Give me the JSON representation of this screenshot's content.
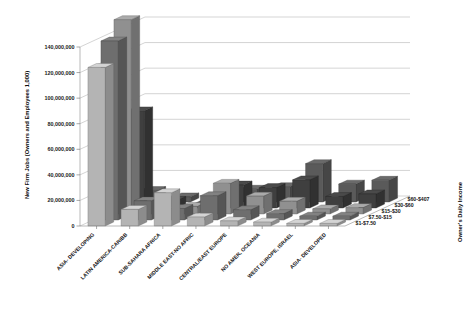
{
  "chart_data": {
    "type": "bar",
    "title": "",
    "subtitle": "",
    "xlabel": "",
    "ylabel": "New Firm Jobs (Owners and Employees 1,000)",
    "zlabel": "Owner's Daily Income",
    "ylim": [
      0,
      140000000
    ],
    "ytick_labels": [
      "0",
      "20,000,000",
      "40,000,000",
      "60,000,000",
      "80,000,000",
      "100,000,000",
      "120,000,000",
      "140,000,000"
    ],
    "ytick_values": [
      0,
      20000000,
      40000000,
      60000000,
      80000000,
      100000000,
      120000000,
      140000000
    ],
    "grid": true,
    "legend_position": "right-depth-axis",
    "projection": "3d-columns",
    "categories": [
      "ASIA- DEVELOPING",
      "LATIN AMERICA-CARIBB",
      "SUB-SAHARA AFRICA",
      "MIDDLE EAST-NO AFRIC",
      "CENTRAL/EAST EUROPE",
      "NO AMER, OCEANIA",
      "WEST EUROPE, ISRAEL",
      "ASIA- DEVELOPED"
    ],
    "depth_categories": [
      "$1-$7.50",
      "$7.50-$15",
      "$15-$30",
      "$30-$60",
      "$60-$407"
    ],
    "series": [
      {
        "name": "$1-$7.50",
        "color": "#b4b4b4",
        "values": [
          124000000,
          13000000,
          26000000,
          7000000,
          4000000,
          3000000,
          2000000,
          2000000
        ]
      },
      {
        "name": "$7.50-$15",
        "color": "#6e6e6e",
        "values": [
          140000000,
          15000000,
          9000000,
          19000000,
          8000000,
          5000000,
          3000000,
          3000000
        ]
      },
      {
        "name": "$15-$30",
        "color": "#909090",
        "values": [
          152000000,
          11000000,
          6000000,
          24000000,
          14000000,
          10000000,
          4000000,
          5000000
        ]
      },
      {
        "name": "$30-$60",
        "color": "#3f3f3f",
        "values": [
          76000000,
          6000000,
          3000000,
          18000000,
          16000000,
          22000000,
          9000000,
          11000000
        ]
      },
      {
        "name": "$60-$407",
        "color": "#5a5a5a",
        "values": [
          9000000,
          4000000,
          2000000,
          10000000,
          12000000,
          30000000,
          14000000,
          17000000
        ]
      }
    ]
  }
}
